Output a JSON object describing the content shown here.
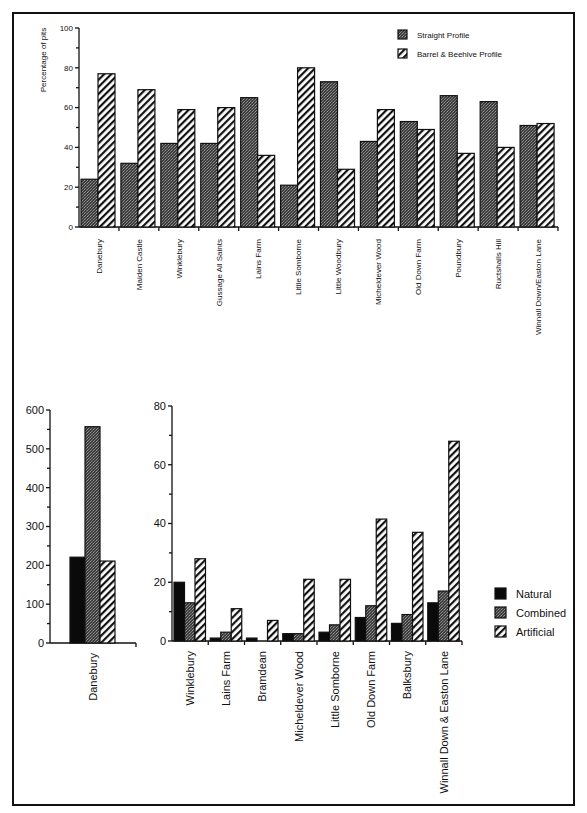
{
  "chart_data": [
    {
      "type": "bar",
      "title": "",
      "xlabel": "",
      "ylabel": "Percentage of pits",
      "ylim": [
        0,
        100
      ],
      "yticks": [
        0,
        20,
        40,
        60,
        80,
        100
      ],
      "grid": false,
      "legend_position": "top-right",
      "categories": [
        "Danebury",
        "Maiden Castle",
        "Winklebury",
        "Gussage All Saints",
        "Lains Farm",
        "Little Somborne",
        "Little Woodbury",
        "Micheldever Wood",
        "Old Down Farm",
        "Poundbury",
        "Ructshalls Hill",
        "Winnall Down/Easton Lane"
      ],
      "series": [
        {
          "name": "Straight Profile",
          "pattern": "dark-stipple",
          "values": [
            24,
            32,
            42,
            42,
            65,
            21,
            73,
            43,
            53,
            66,
            63,
            51
          ]
        },
        {
          "name": "Barrel & Beehive Profile",
          "pattern": "diagonal-hatch",
          "values": [
            77,
            69,
            59,
            60,
            36,
            80,
            29,
            59,
            49,
            37,
            40,
            52
          ]
        }
      ]
    },
    {
      "type": "bar",
      "title": "",
      "xlabel": "",
      "ylabel": "",
      "ylim": [
        0,
        600
      ],
      "yticks": [
        0,
        100,
        200,
        300,
        400,
        500,
        600
      ],
      "grid": false,
      "categories": [
        "Danebury"
      ],
      "series": [
        {
          "name": "Natural",
          "pattern": "solid-black",
          "values": [
            221
          ]
        },
        {
          "name": "Combined",
          "pattern": "dark-stipple",
          "values": [
            557
          ]
        },
        {
          "name": "Artificial",
          "pattern": "diagonal-hatch",
          "values": [
            211
          ]
        }
      ]
    },
    {
      "type": "bar",
      "title": "",
      "xlabel": "",
      "ylabel": "",
      "ylim": [
        0,
        80
      ],
      "yticks": [
        0,
        20,
        40,
        60,
        80
      ],
      "grid": false,
      "legend_position": "right",
      "categories": [
        "Winklebury",
        "Lains Farm",
        "Bramdean",
        "Micheldever Wood",
        "Little Somborne",
        "Old Down Farm",
        "Balksbury",
        "Winnall Down & Easton Lane"
      ],
      "series": [
        {
          "name": "Natural",
          "pattern": "solid-black",
          "values": [
            20,
            1,
            1,
            2.5,
            3,
            8,
            6,
            13
          ]
        },
        {
          "name": "Combined",
          "pattern": "dark-stipple",
          "values": [
            13,
            3,
            0,
            2.5,
            5.5,
            12,
            9,
            17
          ]
        },
        {
          "name": "Artificial",
          "pattern": "diagonal-hatch",
          "values": [
            28,
            11,
            7,
            21,
            21,
            41.5,
            37,
            68
          ]
        }
      ]
    }
  ],
  "legends": {
    "top": [
      "Straight Profile",
      "Barrel & Beehive Profile"
    ],
    "bottom": [
      "Natural",
      "Combined",
      "Artificial"
    ]
  },
  "colors": {
    "stroke": "#111111",
    "natural": "#0a0a0a",
    "stipple_dark": "#3a3a3a",
    "stipple_light": "#8a8a8a",
    "background": "#ffffff"
  }
}
